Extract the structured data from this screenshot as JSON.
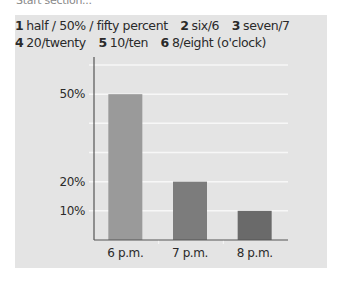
{
  "header_fragment": "Start section...",
  "answer_key": {
    "lines": [
      [
        {
          "num": "1",
          "text": "half / 50% / fifty percent"
        },
        {
          "num": "2",
          "text": "six/6"
        },
        {
          "num": "3",
          "text": "seven/7"
        }
      ],
      [
        {
          "num": "4",
          "text": "20/twenty"
        },
        {
          "num": "5",
          "text": "10/ten"
        },
        {
          "num": "6",
          "text": "8/eight (o'clock)"
        }
      ]
    ]
  },
  "colors": {
    "panel": "#e4e4e4",
    "gridline": "#f7f7f7",
    "axis": "#555555",
    "bars": [
      "#9a9a9a",
      "#7c7c7c",
      "#6a6a6a"
    ]
  },
  "chart_data": {
    "type": "bar",
    "title": "",
    "xlabel": "",
    "ylabel": "",
    "categories": [
      "6 p.m.",
      "7 p.m.",
      "8 p.m."
    ],
    "values": [
      50,
      20,
      10
    ],
    "ylim": [
      0,
      60
    ],
    "y_gridlines": [
      10,
      20,
      30,
      40,
      50,
      60
    ],
    "y_tick_labels": [
      {
        "value": 50,
        "label": "50%"
      },
      {
        "value": 20,
        "label": "20%"
      },
      {
        "value": 10,
        "label": "10%"
      }
    ],
    "grid": true,
    "legend": "none"
  }
}
